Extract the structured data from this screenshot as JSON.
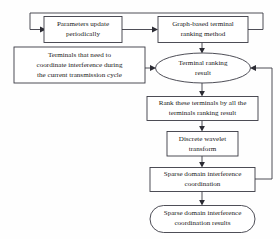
{
  "diagram": {
    "background_color": "#fefefe",
    "line_color": "#3a3a44",
    "text_color": "#1a1a1a",
    "nodes": [
      {
        "id": "parameters-update",
        "shape": "rectangle",
        "lines": [
          "Parameters update",
          "periodically"
        ]
      },
      {
        "id": "graph-based-ranking",
        "shape": "rectangle",
        "lines": [
          "Graph-based terminal",
          "ranking method"
        ]
      },
      {
        "id": "terminals-needing-coordination",
        "shape": "rectangle",
        "lines": [
          "Terminals that need to",
          "coordinate interference during",
          "the current transmission cycle"
        ]
      },
      {
        "id": "terminal-ranking-result",
        "shape": "ellipse",
        "lines": [
          "Terminal ranking",
          "result"
        ]
      },
      {
        "id": "rank-terminals",
        "shape": "rectangle",
        "lines": [
          "Rank these terminals by all the",
          "terminals ranking result"
        ]
      },
      {
        "id": "discrete-wavelet-transform",
        "shape": "rectangle",
        "lines": [
          "Discrete wavelet",
          "transform"
        ]
      },
      {
        "id": "sparse-domain-coordination",
        "shape": "rectangle",
        "lines": [
          "Sparse domain interference",
          "coordination"
        ]
      },
      {
        "id": "coordination-results",
        "shape": "rounded-rectangle",
        "lines": [
          "Sparse domain interference",
          "coordination results"
        ]
      }
    ],
    "edges": [
      {
        "id": "feedback-top-loop",
        "from": "graph-based-ranking",
        "to": "parameters-update",
        "style": "orthogonal-loop"
      },
      {
        "id": "parameters-to-graph",
        "from": "parameters-update",
        "to": "graph-based-ranking",
        "style": "straight"
      },
      {
        "id": "graph-to-ellipse",
        "from": "graph-based-ranking",
        "to": "terminal-ranking-result",
        "style": "straight"
      },
      {
        "id": "terminals-to-ellipse",
        "from": "terminals-needing-coordination",
        "to": "terminal-ranking-result",
        "style": "straight"
      },
      {
        "id": "ellipse-to-rank",
        "from": "terminal-ranking-result",
        "to": "rank-terminals",
        "style": "straight"
      },
      {
        "id": "rank-to-wavelet",
        "from": "rank-terminals",
        "to": "discrete-wavelet-transform",
        "style": "straight"
      },
      {
        "id": "wavelet-to-sparse",
        "from": "discrete-wavelet-transform",
        "to": "sparse-domain-coordination",
        "style": "straight"
      },
      {
        "id": "sparse-to-results",
        "from": "sparse-domain-coordination",
        "to": "coordination-results",
        "style": "straight"
      },
      {
        "id": "feedback-right-loop",
        "from": "sparse-domain-coordination",
        "to": "terminal-ranking-result",
        "style": "orthogonal-loop"
      }
    ]
  }
}
